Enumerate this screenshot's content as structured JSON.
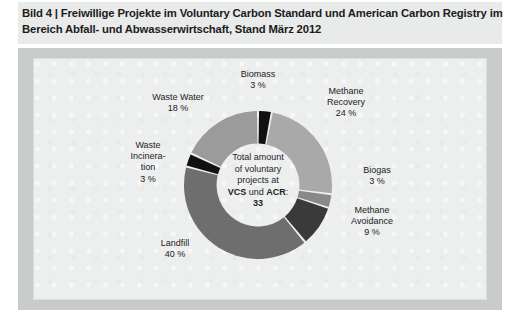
{
  "figure": {
    "caption_line1": "Bild 4 | Freiwillige Projekte im Voluntary Carbon Standard und American Carbon Registry im",
    "caption_line2": "Bereich Abfall- und Abwasserwirtschaft, Stand März 2012"
  },
  "center": {
    "line1": "Total amount",
    "line2": "of voluntary",
    "line3": "projects at",
    "line4_pre": "VCS",
    "line4_mid": " und ",
    "line4_post": "ACR",
    "line4_colon": ":",
    "total": "33"
  },
  "labels": {
    "biomass": "Biomass\n3 %",
    "methane_recovery": "Methane\nRecovery\n24 %",
    "biogas": "Biogas\n3 %",
    "methane_avoidance": "Methane\nAvoidance\n9 %",
    "landfill": "Landfill\n40 %",
    "waste_incineration": "Waste\nIncinera-\ntion\n3 %",
    "waste_water": "Waste Water\n18 %"
  },
  "colors": {
    "page_background": "#ffffff",
    "title_band": "#e9eaea",
    "outer_band": "#c9cbcb",
    "panel": "#edeeee",
    "panel_border": "#dddede",
    "segment_gap": "#ffffff",
    "text": "#1c1c1c"
  },
  "chart_data": {
    "type": "pie",
    "variant": "donut",
    "title": "Bild 4 | Freiwillige Projekte im Voluntary Carbon Standard und American Carbon Registry im Bereich Abfall- und Abwasserwirtschaft, Stand März 2012",
    "center_label": "Total amount of voluntary projects at VCS und ACR: 33",
    "total_projects": 33,
    "unit": "%",
    "start_angle_deg": 0,
    "direction": "clockwise",
    "inner_radius_ratio": 0.56,
    "legend": "none-labels-outside",
    "categories": [
      "Biomass",
      "Methane Recovery",
      "Biogas",
      "Methane Avoidance",
      "Landfill",
      "Waste Incineration",
      "Waste Water"
    ],
    "values": [
      3,
      24,
      3,
      9,
      40,
      3,
      18
    ],
    "slice_colors": [
      "#111111",
      "#a9a9a9",
      "#898989",
      "#3a3a3a",
      "#6e6e6e",
      "#111111",
      "#9b9b9b"
    ],
    "slices": [
      {
        "label": "Biomass",
        "value": 3,
        "value_text": "3 %",
        "color": "#111111"
      },
      {
        "label": "Methane Recovery",
        "value": 24,
        "value_text": "24 %",
        "color": "#a9a9a9"
      },
      {
        "label": "Biogas",
        "value": 3,
        "value_text": "3 %",
        "color": "#898989"
      },
      {
        "label": "Methane Avoidance",
        "value": 9,
        "value_text": "9 %",
        "color": "#3a3a3a"
      },
      {
        "label": "Landfill",
        "value": 40,
        "value_text": "40 %",
        "color": "#6e6e6e"
      },
      {
        "label": "Waste Incineration",
        "value": 3,
        "value_text": "3 %",
        "color": "#111111"
      },
      {
        "label": "Waste Water",
        "value": 18,
        "value_text": "18 %",
        "color": "#9b9b9b"
      }
    ]
  }
}
